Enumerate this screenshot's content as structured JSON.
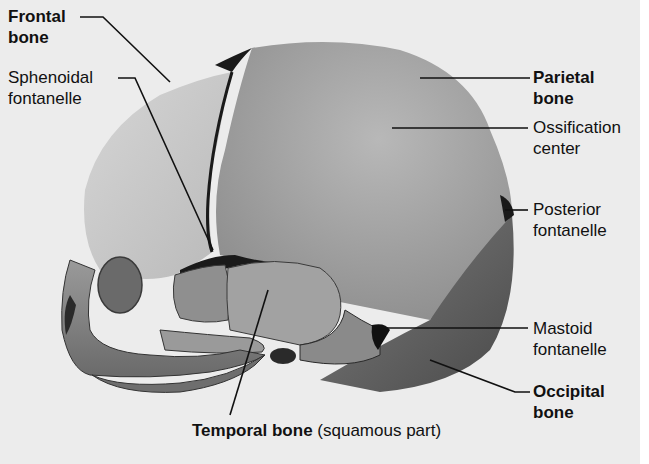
{
  "figure": {
    "background_color": "#ececec",
    "labels": {
      "frontal_bone": {
        "line1": "Frontal",
        "line2": "bone",
        "bold": true
      },
      "sphenoidal_fontanelle": {
        "line1": "Sphenoidal",
        "line2": "fontanelle",
        "bold": false
      },
      "parietal_bone": {
        "line1": "Parietal",
        "line2": "bone",
        "bold": true
      },
      "ossification_center": {
        "line1": "Ossification",
        "line2": "center",
        "bold": false
      },
      "posterior_fontanelle": {
        "line1": "Posterior",
        "line2": "fontanelle",
        "bold": false
      },
      "mastoid_fontanelle": {
        "line1": "Mastoid",
        "line2": "fontanelle",
        "bold": false
      },
      "occipital_bone": {
        "line1": "Occipital",
        "line2": "bone",
        "bold": true
      },
      "temporal_bone": {
        "main": "Temporal bone",
        "qualifier": "(squamous part)"
      }
    },
    "colors": {
      "frontal": "#c9c9c9",
      "parietal": "#a9a9a9",
      "occipital": "#7a7a7a",
      "temporal": "#9c9c9c",
      "face": "#8a8a8a",
      "fontanelle": "#1a1a1a",
      "leader_line": "#111111"
    }
  }
}
